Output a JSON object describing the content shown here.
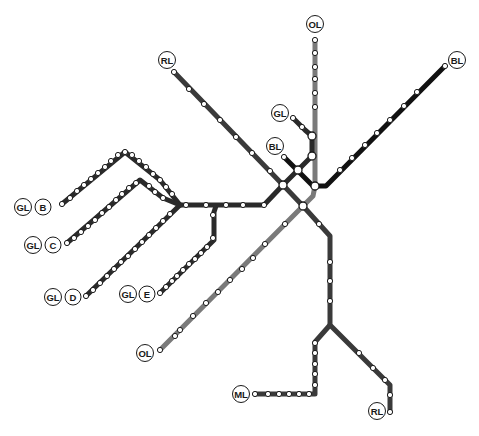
{
  "map": {
    "title": "Rapid transit lines schematic",
    "colors": {
      "RL": "#3a3a3a",
      "OL": "#7a7a7a",
      "GL": "#2a2a2a",
      "BL": "#111111",
      "ML": "#333333",
      "station_fill": "#ffffff",
      "background": "#ffffff"
    },
    "labels": [
      {
        "id": "rl-north",
        "text": "RL",
        "x": 167,
        "y": 60
      },
      {
        "id": "ol-north",
        "text": "OL",
        "x": 315,
        "y": 24
      },
      {
        "id": "bl-east",
        "text": "BL",
        "x": 457,
        "y": 60
      },
      {
        "id": "gl-lechmere",
        "text": "GL",
        "x": 280,
        "y": 113
      },
      {
        "id": "bl-bowdoin",
        "text": "BL",
        "x": 275,
        "y": 146
      },
      {
        "id": "gl-b-line",
        "text": "GL",
        "x": 23,
        "y": 207
      },
      {
        "id": "gl-b-branch",
        "text": "B",
        "x": 43,
        "y": 207
      },
      {
        "id": "gl-c-line",
        "text": "GL",
        "x": 33,
        "y": 245
      },
      {
        "id": "gl-c-branch",
        "text": "C",
        "x": 53,
        "y": 245
      },
      {
        "id": "gl-d-line",
        "text": "GL",
        "x": 53,
        "y": 297
      },
      {
        "id": "gl-d-branch",
        "text": "D",
        "x": 73,
        "y": 297
      },
      {
        "id": "gl-e-line",
        "text": "GL",
        "x": 128,
        "y": 294
      },
      {
        "id": "gl-e-branch",
        "text": "E",
        "x": 147,
        "y": 294
      },
      {
        "id": "ol-south",
        "text": "OL",
        "x": 145,
        "y": 353
      },
      {
        "id": "ml-south",
        "text": "ML",
        "x": 241,
        "y": 394
      },
      {
        "id": "rl-south",
        "text": "RL",
        "x": 377,
        "y": 411
      }
    ]
  }
}
